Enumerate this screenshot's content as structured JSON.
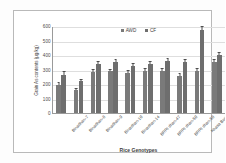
{
  "chart_data": {
    "type": "bar",
    "title": "",
    "xlabel": "Rice Genotypes",
    "ylabel": "Grain As contents (µg/kg)",
    "ylim": [
      0,
      600
    ],
    "yticks": [
      0,
      100,
      200,
      300,
      400,
      500,
      600
    ],
    "grid": true,
    "legend_position": "top-center",
    "categories": [
      "Binadhan-7",
      "Binadhan-8",
      "Binadhan-9",
      "Binadhan-10",
      "Binadhan-14",
      "BRRI dhan-47",
      "BRRI dhan-50",
      "BRRI dhan-58",
      "Khasa Boro",
      "Local Boro"
    ],
    "series": [
      {
        "name": "AWD",
        "color": "#7a7a7a",
        "values": [
          196,
          158,
          285,
          287,
          275,
          290,
          291,
          256,
          291,
          352
        ],
        "errors": [
          14,
          11,
          12,
          13,
          12,
          13,
          13,
          12,
          15,
          16
        ]
      },
      {
        "name": "CF",
        "color": "#6e6e6e",
        "values": [
          265,
          218,
          339,
          352,
          327,
          340,
          357,
          352,
          574,
          399
        ],
        "errors": [
          15,
          12,
          14,
          15,
          13,
          14,
          15,
          14,
          18,
          16
        ]
      }
    ]
  }
}
